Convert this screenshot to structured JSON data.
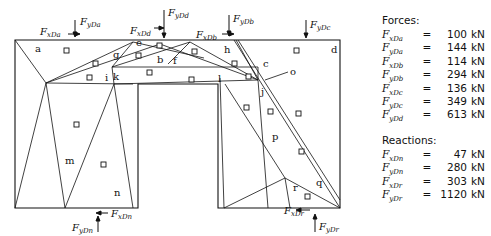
{
  "diagram": {
    "regions": [
      {
        "id": "a",
        "x": 35,
        "y": 52
      },
      {
        "id": "b",
        "x": 157,
        "y": 63
      },
      {
        "id": "c",
        "x": 263,
        "y": 67
      },
      {
        "id": "d",
        "x": 331,
        "y": 53
      },
      {
        "id": "e",
        "x": 136,
        "y": 46
      },
      {
        "id": "f",
        "x": 173,
        "y": 64
      },
      {
        "id": "g",
        "x": 113,
        "y": 58
      },
      {
        "id": "h",
        "x": 224,
        "y": 53
      },
      {
        "id": "i",
        "x": 105,
        "y": 81
      },
      {
        "id": "j",
        "x": 261,
        "y": 95
      },
      {
        "id": "k",
        "x": 113,
        "y": 80
      },
      {
        "id": "l",
        "x": 218,
        "y": 82
      },
      {
        "id": "m",
        "x": 65,
        "y": 164
      },
      {
        "id": "n",
        "x": 114,
        "y": 196
      },
      {
        "id": "o",
        "x": 290,
        "y": 75
      },
      {
        "id": "p",
        "x": 272,
        "y": 140
      },
      {
        "id": "q",
        "x": 316,
        "y": 186
      },
      {
        "id": "r",
        "x": 293,
        "y": 191
      }
    ],
    "force_labels": [
      {
        "main": "F",
        "sub": "xDa",
        "x": 40,
        "y": 35
      },
      {
        "main": "F",
        "sub": "yDa",
        "x": 80,
        "y": 25
      },
      {
        "main": "F",
        "sub": "xDd",
        "x": 130,
        "y": 34
      },
      {
        "main": "F",
        "sub": "yDd",
        "x": 168,
        "y": 16
      },
      {
        "main": "F",
        "sub": "xDb",
        "x": 196,
        "y": 38
      },
      {
        "main": "F",
        "sub": "yDb",
        "x": 233,
        "y": 22
      },
      {
        "main": "F",
        "sub": "yDc",
        "x": 310,
        "y": 28
      },
      {
        "main": "F",
        "sub": "xDn",
        "x": 111,
        "y": 217
      },
      {
        "main": "F",
        "sub": "yDn",
        "x": 72,
        "y": 231
      },
      {
        "main": "F",
        "sub": "xDr",
        "x": 284,
        "y": 214
      },
      {
        "main": "F",
        "sub": "yDr",
        "x": 319,
        "y": 230
      }
    ]
  },
  "panel": {
    "forces_heading": "Forces:",
    "forces": [
      {
        "main": "F",
        "sub": "xDa",
        "eq": "=",
        "value": "100",
        "unit": "kN"
      },
      {
        "main": "F",
        "sub": "yDa",
        "eq": "=",
        "value": "144",
        "unit": "kN"
      },
      {
        "main": "F",
        "sub": "xDb",
        "eq": "=",
        "value": "114",
        "unit": "kN"
      },
      {
        "main": "F",
        "sub": "yDb",
        "eq": "=",
        "value": "294",
        "unit": "kN"
      },
      {
        "main": "F",
        "sub": "xDc",
        "eq": "=",
        "value": "136",
        "unit": "kN"
      },
      {
        "main": "F",
        "sub": "yDc",
        "eq": "=",
        "value": "349",
        "unit": "kN"
      },
      {
        "main": "F",
        "sub": "yDd",
        "eq": "=",
        "value": "613",
        "unit": "kN"
      }
    ],
    "reactions_heading": "Reactions:",
    "reactions": [
      {
        "main": "F",
        "sub": "xDn",
        "eq": "=",
        "value": "47",
        "unit": "kN"
      },
      {
        "main": "F",
        "sub": "yDn",
        "eq": "=",
        "value": "280",
        "unit": "kN"
      },
      {
        "main": "F",
        "sub": "xDr",
        "eq": "=",
        "value": "303",
        "unit": "kN"
      },
      {
        "main": "F",
        "sub": "yDr",
        "eq": "=",
        "value": "1120",
        "unit": "kN"
      }
    ]
  }
}
